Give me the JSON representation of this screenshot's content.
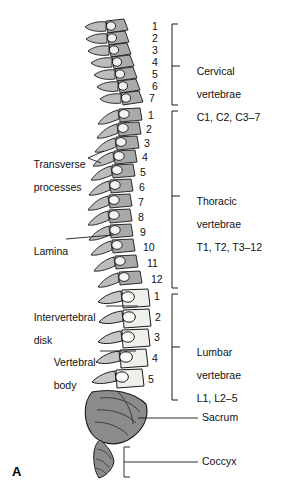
{
  "figure": {
    "panel_label": "A",
    "view": "lateral view of the vertebral column"
  },
  "part_labels": [
    {
      "id": "transverse-processes",
      "line1": "Transverse",
      "line2": "processes"
    },
    {
      "id": "lamina",
      "line1": "Lamina",
      "line2": ""
    },
    {
      "id": "intervertebral-disk",
      "line1": "Intervertebral",
      "line2": "disk"
    },
    {
      "id": "vertebral-body",
      "line1": "Vertebral",
      "line2": "body"
    }
  ],
  "regions": [
    {
      "id": "cervical",
      "line1": "Cervical",
      "line2": "vertebrae",
      "line3": "C1, C2, C3–7",
      "count": 7,
      "numbers": [
        "1",
        "2",
        "3",
        "4",
        "5",
        "6",
        "7"
      ]
    },
    {
      "id": "thoracic",
      "line1": "Thoracic",
      "line2": "vertebrae",
      "line3": "T1, T2, T3–12",
      "count": 12,
      "numbers": [
        "1",
        "2",
        "3",
        "4",
        "5",
        "6",
        "7",
        "8",
        "9",
        "10",
        "11",
        "12"
      ]
    },
    {
      "id": "lumbar",
      "line1": "Lumbar",
      "line2": "vertebrae",
      "line3": "L1, L2–5",
      "count": 5,
      "numbers": [
        "1",
        "2",
        "3",
        "4",
        "5"
      ]
    }
  ],
  "leader_labels": [
    {
      "id": "sacrum",
      "text": "Sacrum"
    },
    {
      "id": "coccyx",
      "text": "Coccyx"
    }
  ],
  "colors": {
    "bone_mid": "#a9a9a7",
    "bone_light": "#efefec",
    "bone_dark": "#8b8b89",
    "outline": "#1a1a1a",
    "text": "#111111",
    "background": "#ffffff"
  }
}
